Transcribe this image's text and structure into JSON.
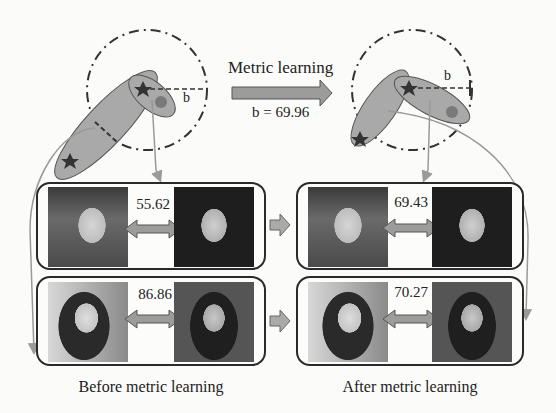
{
  "header": {
    "transform_label": "Metric learning",
    "threshold_label": "b = 69.96"
  },
  "embedding_before": {
    "radius_label": "b"
  },
  "embedding_after": {
    "radius_label": "b"
  },
  "panels": {
    "before": {
      "caption": "Before metric learning",
      "pairs": [
        {
          "distance": "55.62",
          "subject": "man with mustache vs man with glasses"
        },
        {
          "distance": "86.86",
          "subject": "woman with curly hair vs woman"
        }
      ]
    },
    "after": {
      "caption": "After metric learning",
      "pairs": [
        {
          "distance": "69.43",
          "subject": "man with mustache vs man with glasses"
        },
        {
          "distance": "70.27",
          "subject": "woman with curly hair vs woman"
        }
      ]
    }
  },
  "colors": {
    "ellipse_fill": "#a9a9a9",
    "arrow_fill": "#9c9c9c",
    "outline": "#2a2a2a",
    "dot": "#7a7a7a",
    "background": "#fbfbfa"
  }
}
